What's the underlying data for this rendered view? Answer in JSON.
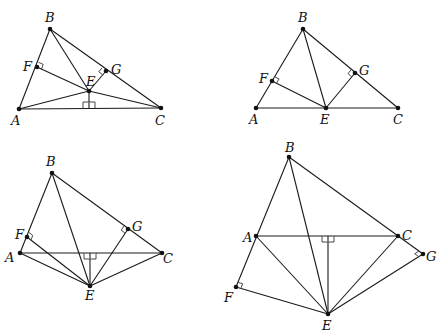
{
  "figures": [
    {
      "id": "fig1",
      "points": {
        "A": {
          "x": 19,
          "y": 109,
          "label": "A",
          "lx": 11,
          "ly": 125
        },
        "B": {
          "x": 50,
          "y": 29,
          "label": "B",
          "lx": 45,
          "ly": 22
        },
        "C": {
          "x": 161,
          "y": 108,
          "label": "C",
          "lx": 155,
          "ly": 125
        },
        "E": {
          "x": 89,
          "y": 91,
          "label": "E",
          "lx": 86,
          "ly": 86
        },
        "F": {
          "x": 37,
          "y": 67,
          "label": "F",
          "lx": 23,
          "ly": 71
        },
        "G": {
          "x": 106,
          "y": 71,
          "label": "G",
          "lx": 111,
          "ly": 74
        }
      },
      "segments": [
        [
          "A",
          "B"
        ],
        [
          "B",
          "C"
        ],
        [
          "A",
          "C"
        ],
        [
          "B",
          "E"
        ],
        [
          "E",
          "F"
        ],
        [
          "E",
          "G"
        ],
        [
          "A",
          "E"
        ],
        [
          "E",
          "C"
        ]
      ],
      "foot": {
        "x": 89,
        "y": 108
      }
    },
    {
      "id": "fig2",
      "points": {
        "A": {
          "x": 256,
          "y": 108,
          "label": "A",
          "lx": 249,
          "ly": 124
        },
        "B": {
          "x": 303,
          "y": 29,
          "label": "B",
          "lx": 298,
          "ly": 22
        },
        "C": {
          "x": 398,
          "y": 108,
          "label": "C",
          "lx": 393,
          "ly": 124
        },
        "E": {
          "x": 326,
          "y": 108,
          "label": "E",
          "lx": 320,
          "ly": 124
        },
        "F": {
          "x": 272,
          "y": 81,
          "label": "F",
          "lx": 259,
          "ly": 83
        },
        "G": {
          "x": 355,
          "y": 73,
          "label": "G",
          "lx": 359,
          "ly": 75
        }
      },
      "segments": [
        [
          "A",
          "B"
        ],
        [
          "B",
          "C"
        ],
        [
          "A",
          "C"
        ],
        [
          "B",
          "E"
        ],
        [
          "E",
          "F"
        ],
        [
          "E",
          "G"
        ]
      ]
    },
    {
      "id": "fig3",
      "points": {
        "A": {
          "x": 20,
          "y": 253,
          "label": "A",
          "lx": 5,
          "ly": 262
        },
        "B": {
          "x": 52,
          "y": 173,
          "label": "B",
          "lx": 46,
          "ly": 166
        },
        "C": {
          "x": 162,
          "y": 253,
          "label": "C",
          "lx": 163,
          "ly": 263
        },
        "E": {
          "x": 90,
          "y": 286,
          "label": "E",
          "lx": 85,
          "ly": 300
        },
        "F": {
          "x": 27,
          "y": 237,
          "label": "F",
          "lx": 15,
          "ly": 239
        },
        "G": {
          "x": 128,
          "y": 229,
          "label": "G",
          "lx": 132,
          "ly": 231
        }
      },
      "segments": [
        [
          "A",
          "B"
        ],
        [
          "B",
          "C"
        ],
        [
          "A",
          "C"
        ],
        [
          "B",
          "E"
        ],
        [
          "E",
          "F"
        ],
        [
          "E",
          "G"
        ],
        [
          "A",
          "E"
        ],
        [
          "E",
          "C"
        ]
      ],
      "foot": {
        "x": 90,
        "y": 253
      }
    },
    {
      "id": "fig4",
      "points": {
        "A": {
          "x": 256,
          "y": 236,
          "label": "A",
          "lx": 243,
          "ly": 242
        },
        "B": {
          "x": 289,
          "y": 157,
          "label": "B",
          "lx": 285,
          "ly": 152
        },
        "C": {
          "x": 398,
          "y": 236,
          "label": "C",
          "lx": 402,
          "ly": 240
        },
        "E": {
          "x": 328,
          "y": 314,
          "label": "E",
          "lx": 322,
          "ly": 330
        },
        "F": {
          "x": 236,
          "y": 287,
          "label": "F",
          "lx": 224,
          "ly": 302
        },
        "G": {
          "x": 423,
          "y": 254,
          "label": "G",
          "lx": 426,
          "ly": 261
        }
      },
      "segments": [
        [
          "F",
          "B"
        ],
        [
          "B",
          "G"
        ],
        [
          "A",
          "C"
        ],
        [
          "B",
          "E"
        ],
        [
          "E",
          "F"
        ],
        [
          "E",
          "G"
        ],
        [
          "A",
          "E"
        ],
        [
          "E",
          "C"
        ]
      ],
      "foot": {
        "x": 328,
        "y": 236
      }
    }
  ]
}
